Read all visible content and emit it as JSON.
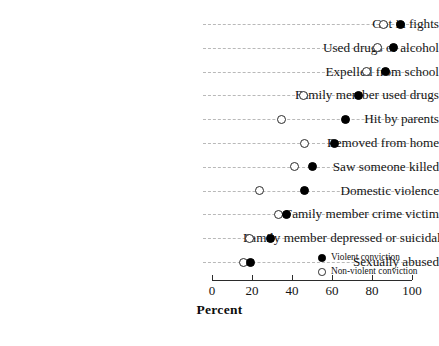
{
  "chart_data": {
    "type": "scatter",
    "subtype": "dot-plot",
    "title": "",
    "xlabel": "Percent",
    "ylabel": "",
    "xlim": [
      0,
      100
    ],
    "xticks": [
      0,
      20,
      40,
      60,
      80,
      100
    ],
    "xtick_labels": [
      "0",
      "20",
      "40",
      "60",
      "80",
      "100"
    ],
    "grid": "horizontal-dashed",
    "legend_position": "inside-lower-right",
    "categories": [
      "Got in fights",
      "Used drugs or alcohol",
      "Expelled from school",
      "Family member used drugs",
      "Hit by parents",
      "Removed from home",
      "Saw someone killed",
      "Domestic violence",
      "Family member crime victim",
      "Family member depressed or suicidal",
      "Sexually abused"
    ],
    "series": [
      {
        "name": "Violent conviction",
        "marker": "filled-circle",
        "color": "#000000",
        "values": [
          94,
          90.5,
          86.5,
          73,
          66.5,
          61,
          50,
          46,
          37,
          29,
          19
        ]
      },
      {
        "name": "Non-violent conviction",
        "marker": "open-circle",
        "color": "#ffffff",
        "values": [
          85.5,
          82.5,
          77,
          45.5,
          34.5,
          46,
          41,
          23.5,
          33,
          18.5,
          15.5
        ]
      }
    ]
  },
  "legend": {
    "entries": [
      {
        "label": "Violent conviction",
        "marker": "filled-circle"
      },
      {
        "label": "Non-violent conviction",
        "marker": "open-circle"
      }
    ]
  },
  "axis": {
    "x_title": "Percent"
  },
  "colors": {
    "ink": "#141414",
    "grid": "#b9b9b9",
    "axis": "#2b2b2b",
    "background": "#ffffff"
  }
}
